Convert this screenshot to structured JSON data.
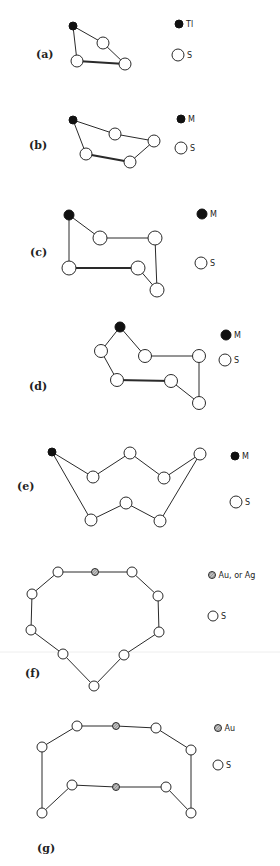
{
  "figure": {
    "panels": [
      {
        "id": "a",
        "label": "(a)",
        "label_pos": [
          36,
          58
        ],
        "legend": [
          {
            "type": "metal",
            "text": "Tl",
            "pos": [
              179,
              24
            ],
            "r": 4
          },
          {
            "type": "sulfur",
            "text": "S",
            "pos": [
              178,
              55
            ],
            "r": 6
          }
        ],
        "atoms": [
          {
            "type": "metal",
            "pos": [
              73,
              26
            ],
            "r": 4
          },
          {
            "type": "sulfur",
            "pos": [
              103,
              43
            ],
            "r": 6
          },
          {
            "type": "sulfur",
            "pos": [
              77,
              61
            ],
            "r": 6
          },
          {
            "type": "sulfur",
            "pos": [
              125,
              64
            ],
            "r": 6
          }
        ],
        "bonds": [
          [
            0,
            1,
            "n"
          ],
          [
            1,
            3,
            "n"
          ],
          [
            0,
            2,
            "n"
          ],
          [
            2,
            3,
            "t"
          ]
        ]
      },
      {
        "id": "b",
        "label": "(b)",
        "label_pos": [
          29,
          149
        ],
        "legend": [
          {
            "type": "metal",
            "text": "M",
            "pos": [
              181,
              119
            ],
            "r": 4
          },
          {
            "type": "sulfur",
            "text": "S",
            "pos": [
              181,
              148
            ],
            "r": 6
          }
        ],
        "atoms": [
          {
            "type": "metal",
            "pos": [
              73,
              120
            ],
            "r": 4
          },
          {
            "type": "sulfur",
            "pos": [
              115,
              134
            ],
            "r": 6
          },
          {
            "type": "sulfur",
            "pos": [
              154,
              141
            ],
            "r": 6
          },
          {
            "type": "sulfur",
            "pos": [
              86,
              154
            ],
            "r": 6
          },
          {
            "type": "sulfur",
            "pos": [
              130,
              162
            ],
            "r": 6
          }
        ],
        "bonds": [
          [
            0,
            1,
            "n"
          ],
          [
            1,
            2,
            "n"
          ],
          [
            2,
            4,
            "n"
          ],
          [
            0,
            3,
            "n"
          ],
          [
            3,
            4,
            "t"
          ]
        ]
      },
      {
        "id": "c",
        "label": "(c)",
        "label_pos": [
          30,
          256
        ],
        "legend": [
          {
            "type": "metal",
            "text": "M",
            "pos": [
              202,
              214
            ],
            "r": 5
          },
          {
            "type": "sulfur",
            "text": "S",
            "pos": [
              201,
              263
            ],
            "r": 6
          }
        ],
        "atoms": [
          {
            "type": "metal",
            "pos": [
              69,
              215
            ],
            "r": 5
          },
          {
            "type": "sulfur",
            "pos": [
              100,
              238
            ],
            "r": 7
          },
          {
            "type": "sulfur",
            "pos": [
              155,
              238
            ],
            "r": 7
          },
          {
            "type": "sulfur",
            "pos": [
              69,
              268
            ],
            "r": 7
          },
          {
            "type": "sulfur",
            "pos": [
              138,
              268
            ],
            "r": 7
          },
          {
            "type": "sulfur",
            "pos": [
              157,
              290
            ],
            "r": 7
          }
        ],
        "bonds": [
          [
            0,
            1,
            "n"
          ],
          [
            1,
            2,
            "n"
          ],
          [
            2,
            5,
            "n"
          ],
          [
            5,
            4,
            "n"
          ],
          [
            4,
            3,
            "t"
          ],
          [
            3,
            0,
            "n"
          ]
        ]
      },
      {
        "id": "d",
        "label": "(d)",
        "label_pos": [
          29,
          390
        ],
        "legend": [
          {
            "type": "metal",
            "text": "M",
            "pos": [
              226,
              335
            ],
            "r": 5
          },
          {
            "type": "sulfur",
            "text": "S",
            "pos": [
              225,
              360
            ],
            "r": 6
          }
        ],
        "atoms": [
          {
            "type": "metal",
            "pos": [
              120,
              327
            ],
            "r": 5
          },
          {
            "type": "sulfur",
            "pos": [
              101,
              351
            ],
            "r": 6.5
          },
          {
            "type": "sulfur",
            "pos": [
              145,
              356
            ],
            "r": 6.5
          },
          {
            "type": "sulfur",
            "pos": [
              199,
              356
            ],
            "r": 6.5
          },
          {
            "type": "sulfur",
            "pos": [
              117,
              380
            ],
            "r": 6.5
          },
          {
            "type": "sulfur",
            "pos": [
              171,
              381
            ],
            "r": 6.5
          },
          {
            "type": "sulfur",
            "pos": [
              199,
              403
            ],
            "r": 6.5
          }
        ],
        "bonds": [
          [
            0,
            1,
            "n"
          ],
          [
            0,
            2,
            "n"
          ],
          [
            2,
            3,
            "n"
          ],
          [
            3,
            6,
            "n"
          ],
          [
            6,
            5,
            "n"
          ],
          [
            5,
            4,
            "t"
          ],
          [
            4,
            1,
            "n"
          ]
        ]
      },
      {
        "id": "e",
        "label": "(e)",
        "label_pos": [
          17,
          490
        ],
        "legend": [
          {
            "type": "metal",
            "text": "M",
            "pos": [
              235,
              456
            ],
            "r": 4
          },
          {
            "type": "sulfur",
            "text": "S",
            "pos": [
              236,
              502
            ],
            "r": 6
          }
        ],
        "atoms": [
          {
            "type": "metal",
            "pos": [
              52,
              452
            ],
            "r": 4
          },
          {
            "type": "sulfur",
            "pos": [
              93,
              477
            ],
            "r": 6
          },
          {
            "type": "sulfur",
            "pos": [
              130,
              453
            ],
            "r": 6
          },
          {
            "type": "sulfur",
            "pos": [
              164,
              478
            ],
            "r": 6
          },
          {
            "type": "sulfur",
            "pos": [
              200,
              454
            ],
            "r": 6
          },
          {
            "type": "sulfur",
            "pos": [
              91,
              520
            ],
            "r": 6
          },
          {
            "type": "sulfur",
            "pos": [
              126,
              503
            ],
            "r": 6
          },
          {
            "type": "sulfur",
            "pos": [
              160,
              521
            ],
            "r": 6
          }
        ],
        "bonds": [
          [
            0,
            1,
            "n"
          ],
          [
            1,
            2,
            "n"
          ],
          [
            2,
            3,
            "n"
          ],
          [
            3,
            4,
            "n"
          ],
          [
            0,
            5,
            "n"
          ],
          [
            5,
            6,
            "n"
          ],
          [
            6,
            7,
            "n"
          ],
          [
            7,
            4,
            "n"
          ]
        ]
      },
      {
        "id": "f",
        "label": "(f)",
        "label_pos": [
          25,
          677
        ],
        "legend": [
          {
            "type": "gold",
            "text": "Au, or Ag",
            "pos": [
              212,
              575
            ],
            "r": 3.5
          },
          {
            "type": "sulfur",
            "text": "S",
            "pos": [
              213,
              616
            ],
            "r": 5
          }
        ],
        "atoms": [
          {
            "type": "gold",
            "pos": [
              95,
              572
            ],
            "r": 3.5
          },
          {
            "type": "sulfur",
            "pos": [
              58,
              572
            ],
            "r": 5
          },
          {
            "type": "sulfur",
            "pos": [
              132,
              572
            ],
            "r": 5
          },
          {
            "type": "sulfur",
            "pos": [
              32,
              594
            ],
            "r": 5
          },
          {
            "type": "sulfur",
            "pos": [
              158,
              596
            ],
            "r": 5
          },
          {
            "type": "sulfur",
            "pos": [
              31,
              630
            ],
            "r": 5
          },
          {
            "type": "sulfur",
            "pos": [
              159,
              632
            ],
            "r": 5
          },
          {
            "type": "sulfur",
            "pos": [
              63,
              654
            ],
            "r": 5
          },
          {
            "type": "sulfur",
            "pos": [
              124,
              655
            ],
            "r": 5
          },
          {
            "type": "sulfur",
            "pos": [
              94,
              686
            ],
            "r": 5
          }
        ],
        "bonds": [
          [
            1,
            0,
            "n"
          ],
          [
            0,
            2,
            "n"
          ],
          [
            1,
            3,
            "n"
          ],
          [
            2,
            4,
            "n"
          ],
          [
            3,
            5,
            "n"
          ],
          [
            4,
            6,
            "n"
          ],
          [
            5,
            7,
            "n"
          ],
          [
            6,
            8,
            "n"
          ],
          [
            7,
            9,
            "n"
          ],
          [
            8,
            9,
            "n"
          ]
        ]
      },
      {
        "id": "g",
        "label": "(g)",
        "label_pos": [
          37,
          852
        ],
        "legend": [
          {
            "type": "gold",
            "text": "Au",
            "pos": [
              218,
              728
            ],
            "r": 3.5
          },
          {
            "type": "sulfur",
            "text": "S",
            "pos": [
              218,
              765
            ],
            "r": 5
          }
        ],
        "atoms": [
          {
            "type": "sulfur",
            "pos": [
              77,
              726
            ],
            "r": 5
          },
          {
            "type": "gold",
            "pos": [
              116,
              726
            ],
            "r": 3.5
          },
          {
            "type": "sulfur",
            "pos": [
              156,
              728
            ],
            "r": 5
          },
          {
            "type": "sulfur",
            "pos": [
              42,
              747
            ],
            "r": 5
          },
          {
            "type": "sulfur",
            "pos": [
              191,
              750
            ],
            "r": 5
          },
          {
            "type": "sulfur",
            "pos": [
              72,
              785
            ],
            "r": 5
          },
          {
            "type": "gold",
            "pos": [
              116,
              787
            ],
            "r": 3.5
          },
          {
            "type": "sulfur",
            "pos": [
              166,
              787
            ],
            "r": 5
          },
          {
            "type": "sulfur",
            "pos": [
              42,
              813
            ],
            "r": 5
          },
          {
            "type": "sulfur",
            "pos": [
              191,
              813
            ],
            "r": 5
          }
        ],
        "bonds": [
          [
            0,
            1,
            "n"
          ],
          [
            1,
            2,
            "n"
          ],
          [
            0,
            3,
            "n"
          ],
          [
            2,
            4,
            "n"
          ],
          [
            3,
            8,
            "n"
          ],
          [
            4,
            9,
            "n"
          ],
          [
            8,
            5,
            "n"
          ],
          [
            5,
            6,
            "n"
          ],
          [
            6,
            7,
            "n"
          ],
          [
            7,
            9,
            "n"
          ]
        ]
      }
    ]
  }
}
